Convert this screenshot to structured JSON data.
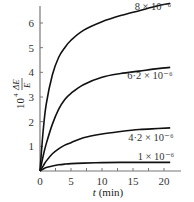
{
  "chart_data": {
    "type": "line",
    "title": "",
    "xlabel": "t (min)",
    "ylabel": "10^4 ΔE/E",
    "xlim": [
      0,
      23
    ],
    "ylim": [
      0,
      7
    ],
    "x_ticks": [
      "0",
      "5",
      "10",
      "15",
      "20"
    ],
    "y_ticks": [
      "1",
      "2",
      "3",
      "4",
      "5",
      "6"
    ],
    "grid": false,
    "legend": "inline labels at right end of curves",
    "series": [
      {
        "name": "8 × 10⁻⁶",
        "x": [
          0,
          0.5,
          1,
          2,
          3,
          4,
          5,
          7,
          10,
          13,
          16,
          19,
          21
        ],
        "values": [
          0,
          1.6,
          2.7,
          3.9,
          4.6,
          5.0,
          5.3,
          5.7,
          6.05,
          6.3,
          6.5,
          6.7,
          6.8
        ]
      },
      {
        "name": "6·2 × 10⁻⁶",
        "x": [
          0,
          0.5,
          1,
          2,
          3,
          4,
          5,
          7,
          10,
          13,
          16,
          19,
          21
        ],
        "values": [
          0,
          0.6,
          1.1,
          1.9,
          2.5,
          2.9,
          3.15,
          3.5,
          3.8,
          3.95,
          4.05,
          4.15,
          4.2
        ]
      },
      {
        "name": "4·2 × 10⁻⁶",
        "x": [
          0,
          0.5,
          1,
          2,
          3,
          4,
          5,
          7,
          10,
          13,
          16,
          19,
          21
        ],
        "values": [
          0,
          0.2,
          0.4,
          0.7,
          0.9,
          1.05,
          1.15,
          1.35,
          1.5,
          1.6,
          1.68,
          1.72,
          1.75
        ]
      },
      {
        "name": "1 × 10⁻⁶",
        "x": [
          0,
          0.5,
          1,
          2,
          3,
          4,
          5,
          7,
          10,
          13,
          16,
          19,
          21
        ],
        "values": [
          0,
          0.08,
          0.14,
          0.2,
          0.25,
          0.28,
          0.3,
          0.32,
          0.34,
          0.35,
          0.35,
          0.35,
          0.35
        ]
      }
    ]
  },
  "labels": {
    "x_axis_title": "t (min)",
    "y_axis_prefix": "10",
    "y_axis_exp": "4",
    "y_axis_num": "ΔE",
    "y_axis_den": "E"
  }
}
